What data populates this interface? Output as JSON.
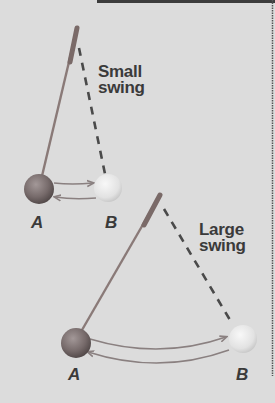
{
  "diagram": {
    "colors": {
      "background": "#dcdcdc",
      "rod": "#8a7a78",
      "dashed_line": "#4a4a4a",
      "ball_a": "#7a6e6e",
      "ball_b": "#ececec",
      "arrow": "#8a8080",
      "text": "#3a3a3a",
      "top_bar": "#3c3c3c",
      "right_border": "#555555"
    },
    "small_pendulum": {
      "label_line1": "Small",
      "label_line2": "swing",
      "point_a": "A",
      "point_b": "B"
    },
    "large_pendulum": {
      "label_line1": "Large",
      "label_line2": "swing",
      "point_a": "A",
      "point_b": "B"
    }
  }
}
